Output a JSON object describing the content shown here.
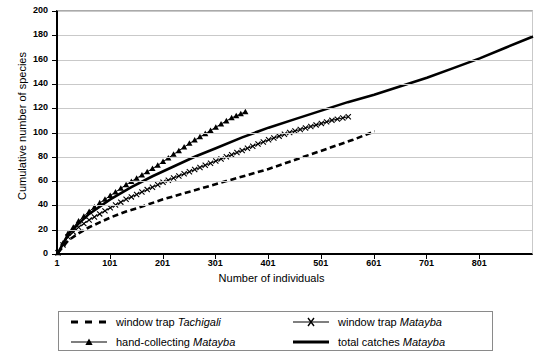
{
  "chart_data": {
    "type": "line",
    "title": "",
    "xlabel": "Number of individuals",
    "ylabel": "Cumulative number of species",
    "xlim": [
      1,
      901
    ],
    "ylim": [
      0,
      200
    ],
    "grid": true,
    "legend_position": "bottom",
    "xticks": [
      1,
      101,
      201,
      301,
      401,
      501,
      601,
      701,
      801
    ],
    "xtick_labels": [
      "1",
      "101",
      "201",
      "301",
      "401",
      "501",
      "601",
      "701",
      "801"
    ],
    "yticks": [
      0,
      20,
      40,
      60,
      80,
      100,
      120,
      140,
      160,
      180,
      200
    ],
    "ytick_labels": [
      "0",
      "20",
      "40",
      "60",
      "80",
      "100",
      "120",
      "140",
      "160",
      "180",
      "200"
    ],
    "series": [
      {
        "name": "window trap Tachigali",
        "label_plain": "window trap ",
        "label_italic": "Tachigali",
        "style": "dashed",
        "marker": "none",
        "color": "#000000",
        "x": [
          1,
          20,
          40,
          60,
          80,
          100,
          130,
          160,
          200,
          240,
          280,
          320,
          360,
          400,
          440,
          480,
          520,
          560,
          601
        ],
        "y": [
          1,
          11,
          17,
          22,
          26,
          30,
          35,
          39,
          45,
          50,
          55,
          60,
          65,
          70,
          76,
          82,
          88,
          94,
          101
        ]
      },
      {
        "name": "window trap Matayba",
        "label_plain": "window trap ",
        "label_italic": "Matayba",
        "style": "solid-thin",
        "marker": "x",
        "color": "#000000",
        "x": [
          1,
          20,
          40,
          60,
          80,
          100,
          130,
          160,
          200,
          240,
          280,
          320,
          360,
          400,
          440,
          480,
          520,
          551
        ],
        "y": [
          1,
          14,
          22,
          28,
          33,
          38,
          45,
          51,
          59,
          66,
          73,
          80,
          87,
          94,
          100,
          105,
          110,
          113
        ]
      },
      {
        "name": "hand-collecting Matayba",
        "label_plain": "hand-collecting ",
        "label_italic": "Matayba",
        "style": "solid-thin",
        "marker": "triangle",
        "color": "#000000",
        "x": [
          1,
          20,
          40,
          60,
          80,
          100,
          130,
          160,
          190,
          220,
          250,
          280,
          310,
          330,
          356
        ],
        "y": [
          1,
          17,
          27,
          35,
          42,
          48,
          57,
          65,
          73,
          82,
          91,
          99,
          107,
          112,
          117
        ]
      },
      {
        "name": "total catches Matayba",
        "label_plain": "total catches ",
        "label_italic": "Matayba",
        "style": "solid-thick",
        "marker": "none",
        "color": "#000000",
        "x": [
          1,
          20,
          40,
          60,
          80,
          100,
          140,
          180,
          220,
          260,
          300,
          350,
          400,
          450,
          500,
          550,
          600,
          650,
          700,
          750,
          800,
          850,
          901
        ],
        "y": [
          1,
          16,
          25,
          33,
          39,
          45,
          55,
          64,
          72,
          80,
          87,
          96,
          104,
          111,
          118,
          125,
          131,
          138,
          145,
          153,
          161,
          170,
          179
        ]
      }
    ]
  }
}
